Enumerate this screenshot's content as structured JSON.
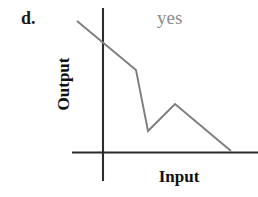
{
  "figure": {
    "panel_letter": "d.",
    "annotation": "yes",
    "annotation_color": "#8c8c8c",
    "axis_color": "#2b2b2b",
    "curve_color": "#7d7d7d",
    "background_color": "#ffffff"
  },
  "chart_data": {
    "type": "line",
    "title": "",
    "subtitle": "",
    "xlabel": "Input",
    "ylabel": "Output",
    "annotations": [
      {
        "text": "d.",
        "role": "panel-letter",
        "x": 21,
        "y": 9
      },
      {
        "text": "yes",
        "role": "verdict",
        "x": 157,
        "y": 8
      }
    ],
    "legend": [],
    "legend_position": "none",
    "grid": false,
    "axis_ticks": [],
    "xlim": [
      0,
      1
    ],
    "ylim": [
      0,
      1
    ],
    "series": [
      {
        "name": "output-curve",
        "points_px": [
          [
            77,
            21
          ],
          [
            136,
            70
          ],
          [
            148,
            131
          ],
          [
            175,
            104
          ],
          [
            231,
            151
          ]
        ]
      }
    ],
    "axes_px": {
      "x_axis": {
        "x1": 72,
        "y1": 152,
        "x2": 258,
        "y2": 152
      },
      "y_axis": {
        "x1": 103,
        "y1": 8,
        "x2": 103,
        "y2": 181
      }
    }
  }
}
